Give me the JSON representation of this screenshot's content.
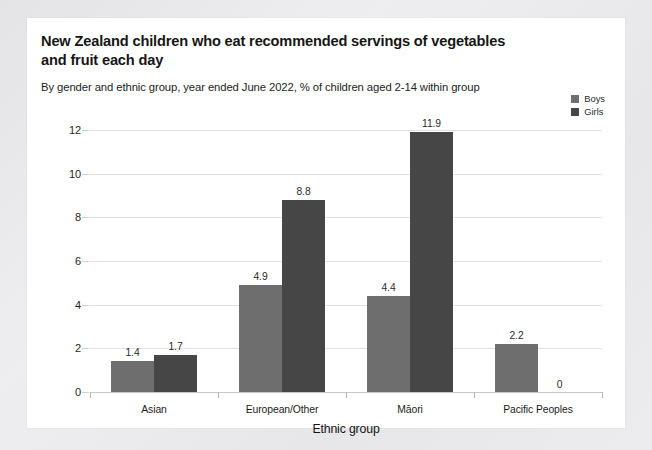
{
  "card": {
    "background": "#ffffff"
  },
  "header": {
    "title": "New Zealand children who eat recommended servings of vegetables and fruit each day",
    "subtitle": "By gender and ethnic group, year ended June 2022, % of children aged 2-14 within group"
  },
  "legend": {
    "position": "top-right",
    "items": [
      {
        "label": "Boys",
        "color": "#6e6e6e"
      },
      {
        "label": "Girls",
        "color": "#464646"
      }
    ]
  },
  "chart_data": {
    "type": "bar",
    "title": "New Zealand children who eat recommended servings of vegetables and fruit each day",
    "subtitle": "By gender and ethnic group, year ended June 2022, % of children aged 2-14 within group",
    "categories": [
      "Asian",
      "European/Other",
      "Māori",
      "Pacific Peoples"
    ],
    "series": [
      {
        "name": "Boys",
        "color": "#6e6e6e",
        "values": [
          1.4,
          4.9,
          4.4,
          2.2
        ],
        "labels": [
          "1.4",
          "4.9",
          "4.4",
          "2.2"
        ]
      },
      {
        "name": "Girls",
        "color": "#464646",
        "values": [
          1.7,
          8.8,
          11.9,
          0
        ],
        "labels": [
          "1.7",
          "8.8",
          "11.9",
          "0"
        ]
      }
    ],
    "xlabel": "Ethnic group",
    "ylabel": "",
    "ylim": [
      0,
      12
    ],
    "yticks": [
      0,
      2,
      4,
      6,
      8,
      10,
      12
    ],
    "ytick_labels": [
      "0",
      "2",
      "4",
      "6",
      "8",
      "10",
      "12"
    ],
    "grid": true,
    "grid_axis": "y",
    "legend_position": "top-right"
  }
}
